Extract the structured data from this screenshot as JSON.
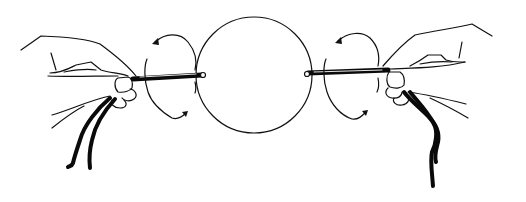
{
  "illustration": {
    "description": "Two hands each holding a cord-wrapped rod on either side of a circle, with curved rotation arrows indicating twisting",
    "colors": {
      "background": "#ffffff",
      "ink": "#0a0a0a"
    },
    "circle": {
      "cx": 254,
      "cy": 75,
      "r": 58
    },
    "left": {
      "rod": {
        "x1": 133,
        "y1": 79,
        "x2": 202,
        "y2": 75
      },
      "rotation": "counter-clockwise-arrows"
    },
    "right": {
      "rod": {
        "x1": 308,
        "y1": 73,
        "x2": 388,
        "y2": 70
      },
      "rotation": "counter-clockwise-arrows"
    }
  }
}
